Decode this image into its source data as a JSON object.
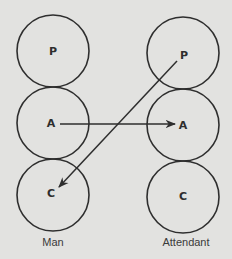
{
  "diagram": {
    "type": "transactional-analysis-ego-states",
    "colors": {
      "background": "#e2e2e0",
      "ink": "#2e2e2e"
    },
    "people": [
      {
        "name": "Man",
        "ego_states": [
          {
            "id": "P",
            "label": "P"
          },
          {
            "id": "A",
            "label": "A"
          },
          {
            "id": "C",
            "label": "C"
          }
        ]
      },
      {
        "name": "Attendant",
        "ego_states": [
          {
            "id": "P",
            "label": "P"
          },
          {
            "id": "A",
            "label": "A"
          },
          {
            "id": "C",
            "label": "C"
          }
        ]
      }
    ],
    "transactions": [
      {
        "from": "Man.A",
        "to": "Attendant.A"
      },
      {
        "from": "Attendant.P",
        "to": "Man.C"
      }
    ]
  }
}
